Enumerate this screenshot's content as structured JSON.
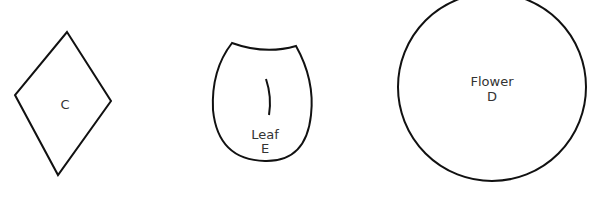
{
  "shapes": [
    {
      "id": "C",
      "type": "diamond",
      "labels": [
        "C"
      ]
    },
    {
      "id": "E",
      "type": "leaf",
      "labels": [
        "Leaf",
        "E"
      ]
    },
    {
      "id": "D",
      "type": "circle",
      "labels": [
        "Flower",
        "D"
      ]
    }
  ],
  "colors": {
    "stroke": "#111111",
    "text": "#333333",
    "background": "#ffffff"
  }
}
